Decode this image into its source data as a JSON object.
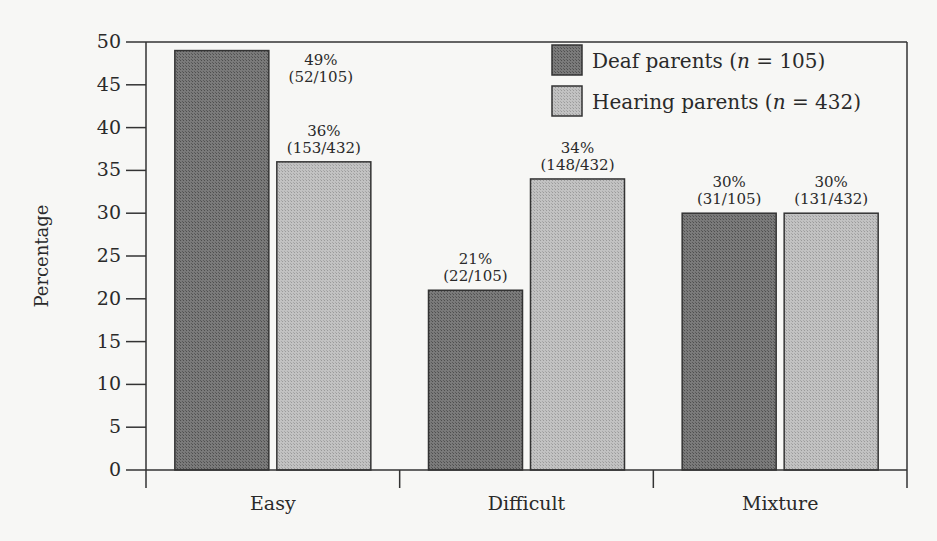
{
  "chart_data": {
    "type": "bar",
    "title": "",
    "xlabel": "",
    "ylabel": "Percentage",
    "ylim": [
      0,
      50
    ],
    "yticks": [
      0,
      5,
      10,
      15,
      20,
      25,
      30,
      35,
      40,
      45,
      50
    ],
    "grid": false,
    "legend_position": "top-right",
    "categories": [
      "Easy",
      "Difficult",
      "Mixture"
    ],
    "series": [
      {
        "name": "Deaf parents",
        "n_label": "n",
        "n_value": "= 105)",
        "legend_prefix": "Deaf parents (",
        "color": "#6e6e6e",
        "values": [
          49,
          21,
          30
        ],
        "labels": [
          "49%",
          "21%",
          "30%"
        ],
        "fractions": [
          "(52/105)",
          "(22/105)",
          "(31/105)"
        ]
      },
      {
        "name": "Hearing parents",
        "n_label": "n",
        "n_value": "= 432)",
        "legend_prefix": "Hearing parents (",
        "color": "#b4b4b4",
        "values": [
          36,
          34,
          30
        ],
        "labels": [
          "36%",
          "34%",
          "30%"
        ],
        "fractions": [
          "(153/432)",
          "(148/432)",
          "(131/432)"
        ]
      }
    ]
  }
}
